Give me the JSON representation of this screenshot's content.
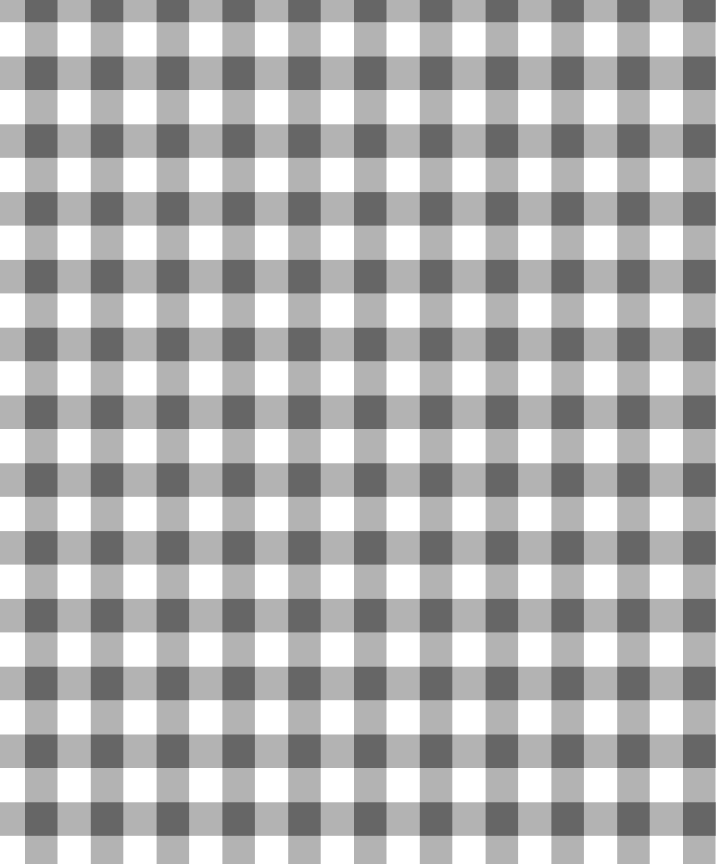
{
  "image": {
    "description": "Gray and white gingham check pattern",
    "width": 716,
    "height": 864
  },
  "pattern": {
    "type": "gingham",
    "colors": {
      "background": "#ffffff",
      "stripe": "#b3b3b3",
      "intersection": "#666666"
    },
    "columns": {
      "period": 65.8,
      "band_width": 32.5,
      "band_start": 25
    },
    "rows": {
      "period": 67.8,
      "band_width": 33.5,
      "band_start": 56.5
    }
  }
}
